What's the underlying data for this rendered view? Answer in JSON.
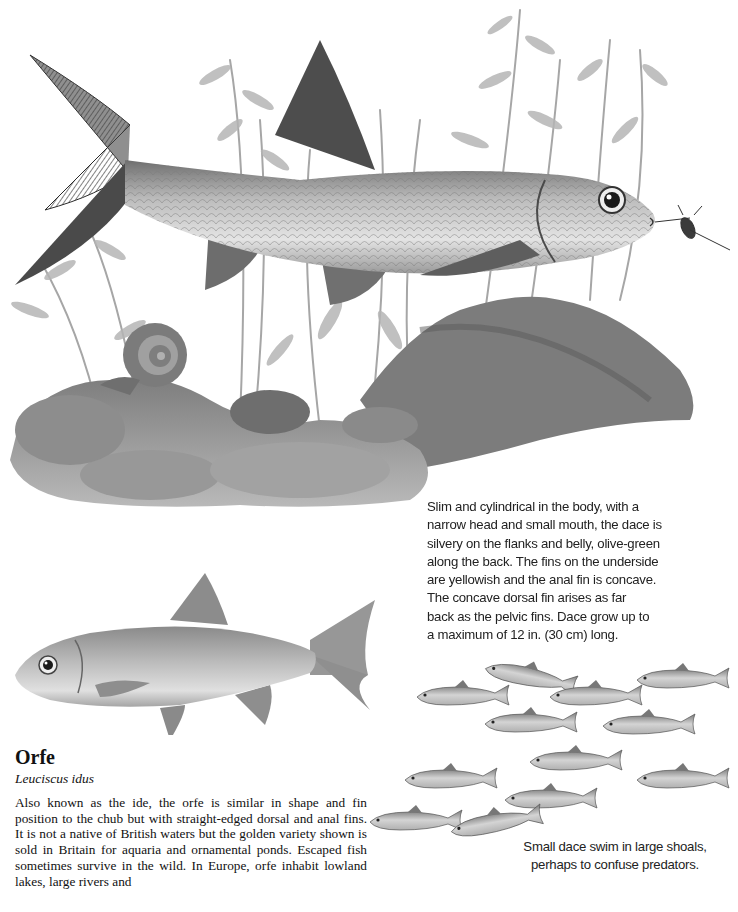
{
  "illustrations": {
    "main_scene": "dace swimming among waterweed with a snail on rocks",
    "orfe_fish": "orfe side view",
    "dace_shoal": "shoal of small dace"
  },
  "dace": {
    "description": "Slim and cylindrical in the body, with a narrow head and small mouth, the dace is silvery on the flanks and belly, olive-green along the back. The fins on the underside are yellowish and the anal fin is concave. The concave dorsal fin arises as far back as the pelvic fins. Dace grow up to a maximum of 12 in. (30 cm) long.",
    "description_lines": [
      "Slim and cylindrical in the body, with a",
      "narrow head and small mouth, the dace is",
      "silvery on the flanks and belly, olive-green",
      "along the back. The fins on the underside",
      "are yellowish and the anal fin is concave.",
      "The concave dorsal fin arises as far",
      "back as the pelvic fins. Dace grow up to",
      "a maximum of 12 in. (30 cm) long."
    ],
    "shoal_caption_lines": [
      "Small dace swim in large shoals,",
      "perhaps to confuse predators."
    ]
  },
  "orfe": {
    "title": "Orfe",
    "latin_name": "Leuciscus idus",
    "body": "Also known as the ide, the orfe is similar in shape and fin position to the chub but with straight-edged dorsal and anal fins. It is not a native of British waters but the golden variety shown is sold in Britain for aquaria and ornamental ponds. Escaped fish sometimes survive in the wild. In Europe, orfe inhabit lowland lakes, large rivers and"
  },
  "colors": {
    "text": "#1a1a1a",
    "background": "#ffffff",
    "pencil_dark": "#3a3a3a",
    "pencil_mid": "#8a8a8a",
    "pencil_light": "#c8c8c8"
  }
}
